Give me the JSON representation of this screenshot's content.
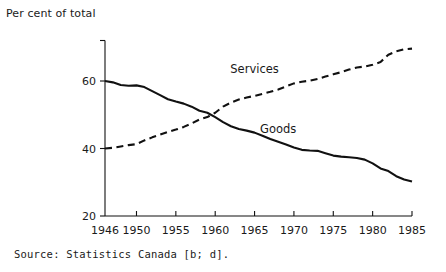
{
  "figure": {
    "axis_title": "Per cent of total",
    "source": "Source:  Statistics  Canada [b;  d].",
    "ink_color": "#111111"
  },
  "chart_data": {
    "type": "line",
    "title": "",
    "subtitle": "",
    "xlabel": "",
    "ylabel": "Per cent of total",
    "xlim": [
      1946,
      1985
    ],
    "ylim": [
      20,
      70
    ],
    "y_axis_range_drawn": [
      20,
      72
    ],
    "yticks": [
      20,
      40,
      60
    ],
    "ytick_labels": [
      "20",
      "40",
      "60"
    ],
    "xticks": [
      1946,
      1950,
      1955,
      1960,
      1965,
      1970,
      1975,
      1980,
      1985
    ],
    "xtick_labels": [
      "1946",
      "1950",
      "1955",
      "1960",
      "1965",
      "1970",
      "1975",
      "1980",
      "1985"
    ],
    "grid": false,
    "legend": "inline-annotations",
    "annotations": [
      {
        "text": "Services",
        "x": 1965,
        "y": 62.5
      },
      {
        "text": "Goods",
        "x": 1968,
        "y": 44.5
      }
    ],
    "x": [
      1946,
      1947,
      1948,
      1949,
      1950,
      1951,
      1952,
      1953,
      1954,
      1955,
      1956,
      1957,
      1958,
      1959,
      1960,
      1961,
      1962,
      1963,
      1964,
      1965,
      1966,
      1967,
      1968,
      1969,
      1970,
      1971,
      1972,
      1973,
      1974,
      1975,
      1976,
      1977,
      1978,
      1979,
      1980,
      1981,
      1982,
      1983,
      1984,
      1985
    ],
    "series": [
      {
        "name": "Goods",
        "style": "solid",
        "color": "#111111",
        "values": [
          60.0,
          59.6,
          58.8,
          58.6,
          58.7,
          58.2,
          57.0,
          55.8,
          54.6,
          53.9,
          53.3,
          52.4,
          51.2,
          50.6,
          49.3,
          47.8,
          46.6,
          45.8,
          45.3,
          44.7,
          43.8,
          42.8,
          42.0,
          41.2,
          40.3,
          39.6,
          39.4,
          39.3,
          38.6,
          37.9,
          37.6,
          37.4,
          37.2,
          36.7,
          35.6,
          34.1,
          33.3,
          31.8,
          30.8,
          30.2
        ]
      },
      {
        "name": "Services",
        "style": "dashed",
        "color": "#111111",
        "values": [
          40.0,
          40.2,
          40.6,
          41.0,
          41.3,
          42.4,
          43.3,
          44.1,
          44.9,
          45.6,
          46.4,
          47.4,
          48.6,
          49.3,
          50.6,
          52.4,
          53.6,
          54.5,
          55.1,
          55.6,
          56.2,
          56.8,
          57.5,
          58.4,
          59.3,
          59.8,
          60.1,
          60.6,
          61.3,
          62.0,
          62.6,
          63.4,
          64.0,
          64.3,
          64.8,
          65.6,
          67.8,
          68.8,
          69.4,
          69.6
        ]
      }
    ]
  }
}
